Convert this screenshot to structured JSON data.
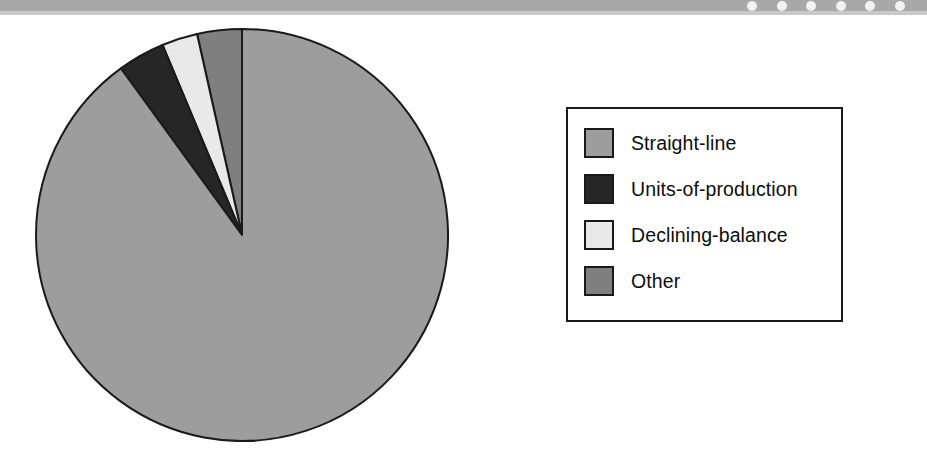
{
  "page": {
    "background_color": "#ffffff",
    "width": 927,
    "height": 464
  },
  "top_band": {
    "name": "scanner-edge-band",
    "color": "#a8a8a8",
    "shadow_color": "#c9c9c9",
    "dot_color": "#f2f2f2",
    "dots": [
      {
        "x": 747
      },
      {
        "x": 777
      },
      {
        "x": 806
      },
      {
        "x": 836
      },
      {
        "x": 865
      },
      {
        "x": 895
      }
    ]
  },
  "chart_data": {
    "type": "pie",
    "title": "",
    "subtitle": "",
    "xlabel": "",
    "ylabel": "",
    "grid": false,
    "legend_position": "right",
    "start_angle_deg": 90,
    "direction": "counterclockwise",
    "center": {
      "x": 207,
      "y": 207
    },
    "radius": 206,
    "stroke_color": "#1a1a1a",
    "stroke_width": 2,
    "categories": [
      "Straight-line",
      "Units-of-production",
      "Declining-balance",
      "Other"
    ],
    "values": [
      90.0,
      3.7,
      2.8,
      3.5
    ],
    "value_unit": "percent",
    "colors": [
      "#9d9d9d",
      "#262626",
      "#e9e9e9",
      "#7f7f7f"
    ],
    "slices": [
      {
        "label": "Other",
        "value": 3.5,
        "color": "#7f7f7f",
        "angle_deg": 12.6
      },
      {
        "label": "Declining-balance",
        "value": 2.8,
        "color": "#e9e9e9",
        "angle_deg": 10.1
      },
      {
        "label": "Units-of-production",
        "value": 3.7,
        "color": "#262626",
        "angle_deg": 13.3
      },
      {
        "label": "Straight-line",
        "value": 90.0,
        "color": "#9d9d9d",
        "angle_deg": 324.0
      }
    ]
  },
  "legend": {
    "border_color": "#1a1a1a",
    "background": "#ffffff",
    "items": [
      {
        "label": "Straight-line",
        "color": "#9d9d9d"
      },
      {
        "label": "Units-of-production",
        "color": "#262626"
      },
      {
        "label": "Declining-balance",
        "color": "#e9e9e9"
      },
      {
        "label": "Other",
        "color": "#7f7f7f"
      }
    ]
  }
}
